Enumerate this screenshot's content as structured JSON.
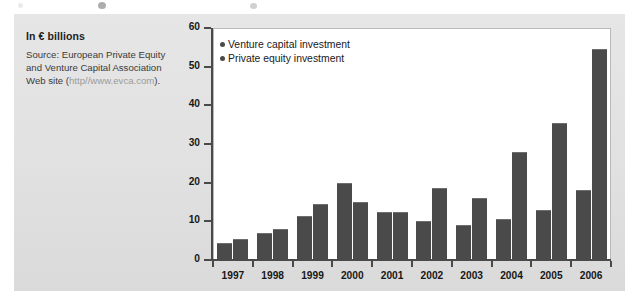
{
  "caption": {
    "title": "In € billions",
    "source_line1": "Source: European Private Equity",
    "source_line2": "and Venture Capital Association",
    "source_line3_prefix": "Web site (",
    "source_url": "http//www.evca.com",
    "source_line3_suffix": ")."
  },
  "colors": {
    "bar": "#4a4a4a",
    "panel_background": "#e3e3e3",
    "plot_background": "#ffffff",
    "axis": "#4a4a4a",
    "text": "#171717",
    "url_text": "#9b9b9b"
  },
  "chart_data": {
    "type": "bar",
    "title": "In € billions",
    "xlabel": "",
    "ylabel": "",
    "ylim": [
      0,
      60
    ],
    "yticks": [
      0,
      10,
      20,
      30,
      40,
      50,
      60
    ],
    "grid": false,
    "legend_position": "top-left",
    "categories": [
      "1997",
      "1998",
      "1999",
      "2000",
      "2001",
      "2002",
      "2003",
      "2004",
      "2005",
      "2006"
    ],
    "series": [
      {
        "name": "Venture capital investment",
        "values": [
          4.5,
          7.0,
          11.5,
          20.0,
          12.5,
          10.0,
          9.0,
          10.5,
          13.0,
          18.0
        ]
      },
      {
        "name": "Private equity investment",
        "values": [
          5.5,
          8.0,
          14.5,
          15.0,
          12.5,
          18.5,
          16.0,
          28.0,
          35.5,
          54.5
        ]
      }
    ]
  }
}
